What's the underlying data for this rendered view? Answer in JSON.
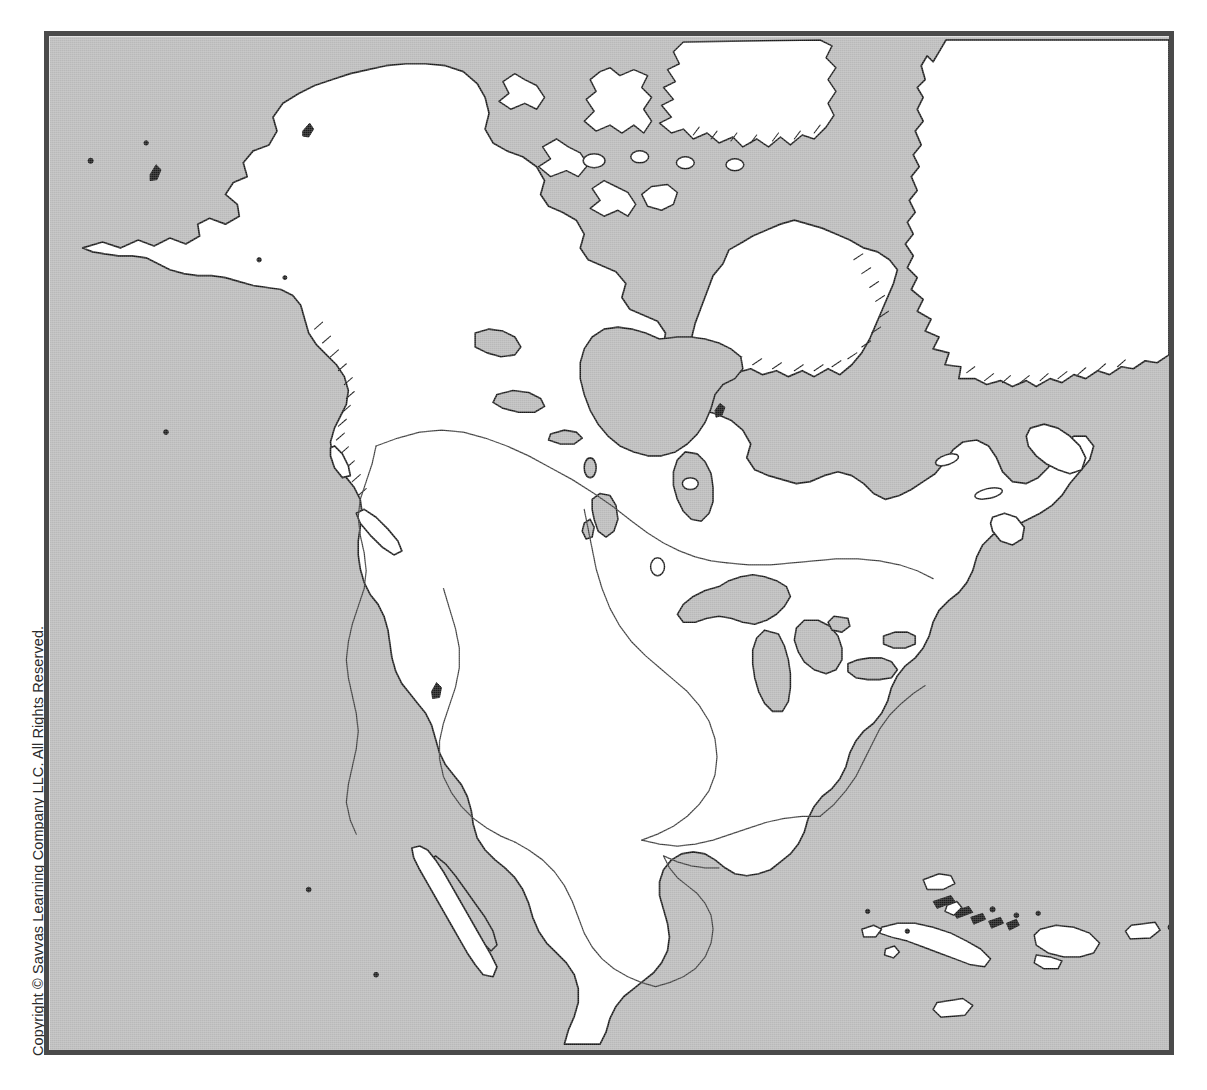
{
  "page": {
    "background_color": "#ffffff",
    "copyright_notice": "Copyright © Savvas Learning Company LLC. All Rights Reserved."
  },
  "map": {
    "title": "North America Outline Map",
    "frame": {
      "border_color": "#4a4a4a",
      "border_width_px": 5,
      "x": 44,
      "y": 31,
      "width": 1130,
      "height": 1024
    },
    "colors": {
      "ocean": "#b9b9b9",
      "land": "#ffffff",
      "coastline": "#1a1a1a",
      "region_boundary": "#3c3c3c"
    },
    "legend_present": false,
    "labels_present": false,
    "scale_bar_present": false,
    "compass_rose_present": false,
    "projection_note": "",
    "features": {
      "landmasses": [
        "Alaska",
        "Canada mainland",
        "Canadian Arctic Archipelago",
        "Greenland (southwest coast)",
        "Baffin Island",
        "Victoria Island",
        "Banks Island",
        "Ellesmere Island",
        "Newfoundland",
        "Nova Scotia",
        "Contiguous United States",
        "Mexico",
        "Baja California Peninsula",
        "Yucatan Peninsula",
        "Central America",
        "Cuba",
        "Hispaniola",
        "Jamaica",
        "Puerto Rico",
        "Bahamas",
        "Vancouver Island",
        "Haida Gwaii"
      ],
      "water_bodies": [
        "Pacific Ocean",
        "Atlantic Ocean",
        "Arctic Ocean",
        "Beaufort Sea",
        "Hudson Bay",
        "James Bay",
        "Gulf of Mexico",
        "Caribbean Sea",
        "Gulf of California",
        "Gulf of St. Lawrence",
        "Lake Superior",
        "Lake Michigan",
        "Lake Huron",
        "Lake Erie",
        "Lake Ontario",
        "Great Bear Lake",
        "Great Slave Lake",
        "Lake Winnipeg",
        "Lake Athabasca",
        "Great Salt Lake"
      ],
      "boundary_type": "regional outline (no political labels)"
    }
  }
}
